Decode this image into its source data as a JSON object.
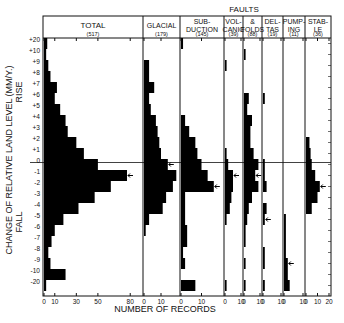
{
  "chart_data": {
    "type": "bar",
    "orientation": "horizontal",
    "title": "",
    "ylabel": "CHANGE OF RELATIVE LAND LEVEL (MM/Y.)",
    "ylabel_rise": "RISE",
    "ylabel_fall": "FALL",
    "xlabel": "NUMBER OF RECORDS",
    "group_header": "FAULTS",
    "categories": [
      "+20",
      "+10",
      "+9",
      "+8",
      "+7",
      "+6",
      "+5",
      "+4",
      "+3",
      "+2",
      "+1",
      "0",
      "-1",
      "-2",
      "-3",
      "-4",
      "-5",
      "-6",
      "-7",
      "-8",
      "-9",
      "-10",
      "-20"
    ],
    "grid": false,
    "series": [
      {
        "name": "TOTAL",
        "count": "(517)",
        "xmax": 90,
        "ticks": [
          "0",
          "10",
          "30",
          "50",
          "80"
        ],
        "tick_values": [
          0,
          10,
          30,
          50,
          80
        ],
        "values": [
          3,
          2,
          4,
          6,
          12,
          10,
          15,
          20,
          22,
          30,
          37,
          50,
          77,
          62,
          47,
          32,
          18,
          10,
          7,
          4,
          6,
          20,
          2
        ],
        "arrow_row": "-1"
      },
      {
        "name": "GLACIAL",
        "count": "(179)",
        "xmax": 20,
        "ticks": [
          "0",
          "10"
        ],
        "tick_values": [
          0,
          10
        ],
        "values": [
          0,
          0,
          3,
          3,
          6,
          3,
          4,
          7,
          8,
          9,
          10,
          14,
          19,
          17,
          13,
          11,
          3,
          1,
          0,
          0,
          0,
          0,
          0
        ],
        "arrow_row": "0"
      },
      {
        "name": "SUB-\nDUCTION",
        "count": "(145)",
        "xmax": 20,
        "ticks": [
          "0",
          "10"
        ],
        "tick_values": [
          0,
          10
        ],
        "values": [
          1,
          0,
          0,
          0,
          0,
          0,
          0,
          2,
          4,
          7,
          8,
          10,
          13,
          16,
          2,
          2,
          2,
          3,
          3,
          1,
          2,
          0,
          7
        ],
        "arrow_row": "-2"
      },
      {
        "name": "VOL-\nCANIC",
        "count": "(39)",
        "xmax": 10,
        "ticks": [
          "0",
          "10"
        ],
        "tick_values": [
          0,
          10
        ],
        "values": [
          0,
          0,
          1,
          0,
          0,
          0,
          0,
          0,
          0,
          0,
          1,
          2,
          5,
          5,
          4,
          3,
          1,
          0,
          0,
          0,
          0,
          0,
          1
        ],
        "arrow_row": "-1"
      },
      {
        "name": "&\nFOLDS",
        "count": "(88)",
        "xmax": 10,
        "ticks": [
          "0",
          "10"
        ],
        "tick_values": [
          0,
          10
        ],
        "values": [
          0,
          1,
          0,
          0,
          0,
          3,
          2,
          5,
          4,
          4,
          6,
          9,
          7,
          9,
          5,
          3,
          2,
          1,
          1,
          0,
          1,
          0,
          1
        ],
        "arrow_row": "-1"
      },
      {
        "name": "DEL-\nTAS",
        "count": "(19)",
        "xmax": 10,
        "ticks": [
          "0",
          "10"
        ],
        "tick_values": [
          0,
          10
        ],
        "values": [
          0,
          0,
          0,
          0,
          0,
          1,
          0,
          0,
          0,
          0,
          0,
          1,
          1,
          2,
          0,
          2,
          1,
          0,
          0,
          1,
          1,
          0,
          1
        ],
        "arrow_row": "-5"
      },
      {
        "name": "PUMP-\nING",
        "count": "(11)",
        "xmax": 10,
        "ticks": [
          "0",
          "10"
        ],
        "tick_values": [
          0,
          10
        ],
        "values": [
          0,
          0,
          0,
          0,
          0,
          0,
          0,
          0,
          0,
          0,
          0,
          0,
          0,
          0,
          0,
          0,
          1,
          1,
          1,
          1,
          2,
          2,
          3
        ],
        "arrow_row": "-9"
      },
      {
        "name": "STAB-\nLE",
        "count": "(36)",
        "xmax": 20,
        "ticks": [
          "0",
          "10",
          "20"
        ],
        "tick_values": [
          0,
          10,
          20
        ],
        "values": [
          0,
          0,
          0,
          0,
          0,
          0,
          0,
          0,
          0,
          3,
          4,
          5,
          8,
          12,
          10,
          5,
          0,
          0,
          0,
          0,
          0,
          0,
          0
        ],
        "arrow_row": "-2"
      }
    ]
  },
  "labels": {
    "faults": "FAULTS",
    "xlabel": "NUMBER OF RECORDS",
    "ylabel": "CHANGE OF RELATIVE LAND LEVEL (MM/Y.)",
    "rise": "RISE",
    "fall": "FALL"
  }
}
